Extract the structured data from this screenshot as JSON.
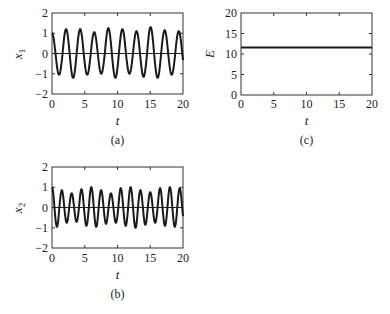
{
  "chart_data": [
    {
      "id": "a",
      "type": "line",
      "caption": "(a)",
      "xlabel": "t",
      "ylabel": "x",
      "ylabel_sub": "1",
      "xlim": [
        0,
        20
      ],
      "ylim": [
        -2,
        2
      ],
      "xticks": [
        0,
        5,
        10,
        15,
        20
      ],
      "yticks": [
        -2,
        -1,
        0,
        1,
        2
      ],
      "grid": false,
      "zero_line": true,
      "series": [
        {
          "name": "x1",
          "description": "oscillation starting near 1, ~9.3 cycles over t in [0,20], peaks ~1.05-1.3, troughs ~-1.0 to -1.2",
          "period": 2.15,
          "phase_start_value": 1.0,
          "peaks": [
            1.2,
            1.2,
            1.05,
            1.25,
            1.2,
            1.1,
            1.3,
            1.15,
            1.1
          ],
          "troughs": [
            -1.05,
            -1.2,
            -1.05,
            -1.0,
            -1.2,
            -1.0,
            -1.15,
            -1.2,
            -1.05,
            -1.0
          ]
        }
      ]
    },
    {
      "id": "b",
      "type": "line",
      "caption": "(b)",
      "xlabel": "t",
      "ylabel": "x",
      "ylabel_sub": "2",
      "xlim": [
        0,
        20
      ],
      "ylim": [
        -2,
        2
      ],
      "xticks": [
        0,
        5,
        10,
        15,
        20
      ],
      "yticks": [
        -2,
        -1,
        0,
        1,
        2
      ],
      "grid": false,
      "zero_line": true,
      "series": [
        {
          "name": "x2",
          "description": "oscillation starting near 1, ~13 cycles over t in [0,20], amplitude ~0.7-1.0",
          "period": 1.5,
          "phase_start_value": 1.0,
          "peaks": [
            0.85,
            0.7,
            0.9,
            1.0,
            0.85,
            0.7,
            0.95,
            1.0,
            0.85,
            0.75,
            0.95,
            1.0,
            0.95
          ],
          "troughs": [
            -0.95,
            -0.75,
            -0.7,
            -0.9,
            -0.95,
            -0.8,
            -0.75,
            -0.9,
            -1.0,
            -0.85,
            -0.75,
            -0.9,
            -0.95,
            -0.85
          ]
        }
      ]
    },
    {
      "id": "c",
      "type": "line",
      "caption": "(c)",
      "xlabel": "t",
      "ylabel": "E",
      "ylabel_sub": "",
      "xlim": [
        0,
        20
      ],
      "ylim": [
        0,
        20
      ],
      "xticks": [
        0,
        5,
        10,
        15,
        20
      ],
      "yticks": [
        0,
        5,
        10,
        15,
        20
      ],
      "grid": false,
      "zero_line": false,
      "series": [
        {
          "name": "E",
          "description": "constant energy",
          "x": [
            0,
            20
          ],
          "y": [
            11.6,
            11.6
          ]
        }
      ]
    }
  ],
  "panels": {
    "a": {
      "caption": "(a)",
      "xlabel": "t",
      "ylabel": "x",
      "ylabel_sub": "1",
      "xticks": [
        "0",
        "5",
        "10",
        "15",
        "20"
      ],
      "yticks": [
        "2",
        "1",
        "0",
        "−1",
        "−2"
      ]
    },
    "b": {
      "caption": "(b)",
      "xlabel": "t",
      "ylabel": "x",
      "ylabel_sub": "2",
      "xticks": [
        "0",
        "5",
        "10",
        "15",
        "20"
      ],
      "yticks": [
        "2",
        "1",
        "0",
        "−1",
        "−2"
      ]
    },
    "c": {
      "caption": "(c)",
      "xlabel": "t",
      "ylabel": "E",
      "xticks": [
        "0",
        "5",
        "10",
        "15",
        "20"
      ],
      "yticks": [
        "20",
        "15",
        "10",
        "5",
        "0"
      ]
    }
  },
  "colors": {
    "line": "#1a1a1a",
    "axis": "#333333",
    "background": "#ffffff"
  }
}
